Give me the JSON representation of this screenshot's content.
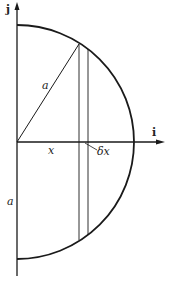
{
  "diagram": {
    "axes": {
      "vertical_label": "j",
      "horizontal_label": "i"
    },
    "labels": {
      "radius_top": "a",
      "radius_bottom": "a",
      "x_distance": "x",
      "strip_width": "δx"
    },
    "geometry": {
      "shape": "semicircle",
      "center": [
        17,
        142
      ],
      "radius_px": 117,
      "strip_x_px": [
        79,
        88
      ]
    },
    "colors": {
      "line": "#1a1a1a",
      "background": "#ffffff"
    }
  }
}
